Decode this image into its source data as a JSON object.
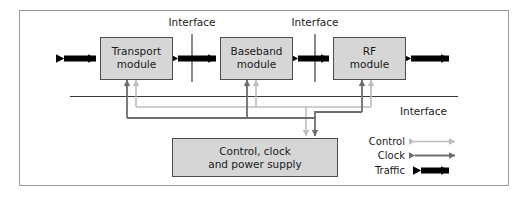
{
  "figure": {
    "frame": {
      "border_color": "#9a9aa0"
    },
    "colors": {
      "module_fill": "#d6d6d6",
      "module_stroke": "#4d4d4d",
      "traffic": "#000000",
      "clock": "#6e6e6e",
      "control": "#bdbdbd",
      "text": "#1a1a1a",
      "rule": "#4d4d4d"
    }
  },
  "modules": [
    {
      "id": "transport",
      "line1": "Transport",
      "line2": "module"
    },
    {
      "id": "baseband",
      "line1": "Baseband",
      "line2": "module"
    },
    {
      "id": "rf",
      "line1": "RF",
      "line2": "module"
    }
  ],
  "support_block": {
    "line1": "Control, clock",
    "line2": "and power supply"
  },
  "interface_labels": {
    "top_left": "Interface",
    "top_right": "Interface",
    "bus_right": "Interface"
  },
  "legend": {
    "items": [
      {
        "id": "control",
        "label": "Control",
        "color": "#bdbdbd",
        "weight": "thin"
      },
      {
        "id": "clock",
        "label": "Clock",
        "color": "#6e6e6e",
        "weight": "medium"
      },
      {
        "id": "traffic",
        "label": "Traffic",
        "color": "#000000",
        "weight": "thick"
      }
    ]
  }
}
